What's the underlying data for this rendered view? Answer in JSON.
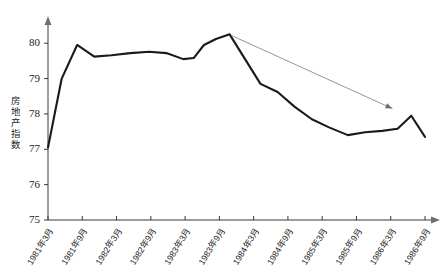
{
  "chart_data": {
    "type": "line",
    "title": "",
    "xlabel": "",
    "ylabel": "房地产指数",
    "ylim": [
      75,
      80.6
    ],
    "yticks": [
      75,
      76,
      77,
      78,
      79,
      80
    ],
    "ytick_labels": [
      "75",
      "76",
      "77",
      "78",
      "79",
      "80"
    ],
    "grid": false,
    "legend": "none",
    "categories": [
      "1981年3月",
      "1981年9月",
      "1982年3月",
      "1982年9月",
      "1983年3月",
      "1983年9月",
      "1984年3月",
      "1984年9月",
      "1985年3月",
      "1985年9月",
      "1986年3月",
      "1986年9月"
    ],
    "series": [
      {
        "name": "房地产指数",
        "color": "#1a1a1a",
        "x": [
          0.0,
          0.4,
          0.85,
          1.35,
          1.85,
          2.4,
          2.95,
          3.45,
          3.95,
          4.25,
          4.55,
          4.9,
          5.3,
          5.75,
          6.2,
          6.7,
          7.2,
          7.7,
          8.2,
          8.75,
          9.25,
          9.75,
          10.2,
          10.6,
          11.0
        ],
        "values": [
          77.05,
          79.0,
          79.95,
          79.62,
          79.66,
          79.72,
          79.76,
          79.72,
          79.55,
          79.58,
          79.95,
          80.12,
          80.25,
          79.55,
          78.85,
          78.62,
          78.2,
          77.85,
          77.62,
          77.4,
          77.48,
          77.52,
          77.58,
          77.95,
          77.35
        ]
      }
    ],
    "annotations": [
      {
        "name": "downtrend-arrow",
        "type": "arrow",
        "color": "#8a8a8a",
        "from_x": 5.35,
        "from_y": 80.22,
        "to_x": 10.05,
        "to_y": 78.15
      }
    ]
  }
}
